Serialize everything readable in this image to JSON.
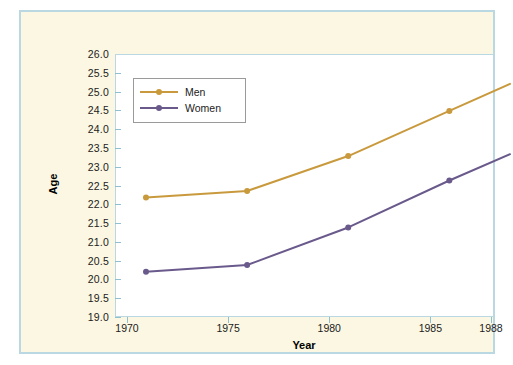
{
  "chart_data": {
    "type": "line",
    "title": "",
    "xlabel": "Year",
    "ylabel": "Age",
    "x": [
      1970,
      1975,
      1980,
      1985,
      1988
    ],
    "categories": [
      "1970",
      "1975",
      "1980",
      "1985",
      "1988"
    ],
    "xtick_labels": [
      "1970",
      "1975",
      "1980",
      "1985",
      "1988"
    ],
    "ytick_labels": [
      "26.0",
      "25.5",
      "25.0",
      "24.5",
      "24.0",
      "23.5",
      "23.0",
      "22.5",
      "22.0",
      "21.5",
      "21.0",
      "20.5",
      "20.0",
      "19.5",
      "19.0"
    ],
    "ytick_values": [
      26.0,
      25.5,
      25.0,
      24.5,
      24.0,
      23.5,
      23.0,
      22.5,
      22.0,
      21.5,
      21.0,
      20.5,
      20.0,
      19.5,
      19.0
    ],
    "ylim": [
      19.0,
      26.0
    ],
    "xlim": [
      1970,
      1988
    ],
    "grid": false,
    "legend_position": "upper-left-inside",
    "series": [
      {
        "name": "Men",
        "color": "#c99a3d",
        "marker": "circle",
        "values": [
          22.45,
          22.62,
          23.55,
          24.75,
          25.47
        ]
      },
      {
        "name": "Women",
        "color": "#6a5a8c",
        "marker": "circle",
        "values": [
          20.47,
          20.65,
          21.65,
          22.9,
          23.6
        ]
      }
    ],
    "colors": {
      "men": "#c99a3d",
      "women": "#6a5a8c",
      "panel_background": "#fbf7e2",
      "panel_border": "#b9d8e2",
      "plot_background": "#ffffff",
      "axis": "#8fc0cf",
      "text": "#1b1b1b"
    }
  },
  "legend": {
    "entries": [
      {
        "label": "Men"
      },
      {
        "label": "Women"
      }
    ]
  }
}
